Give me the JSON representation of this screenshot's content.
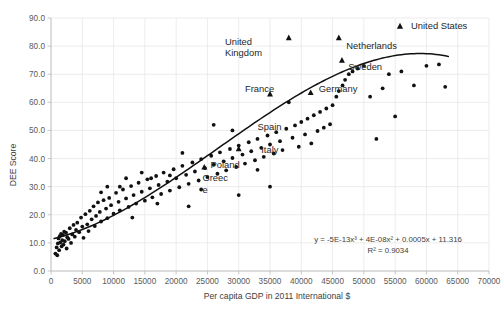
{
  "chart_data": {
    "type": "scatter",
    "title": "",
    "xlabel": "Per capita GDP in 2011 International $",
    "ylabel": "DEE Score",
    "xlim": [
      0,
      70000
    ],
    "ylim": [
      0.0,
      90.0
    ],
    "xticks": [
      "0",
      "5000",
      "10000",
      "15000",
      "20000",
      "25000",
      "30000",
      "35000",
      "40000",
      "45000",
      "50000",
      "55000",
      "60000",
      "65000",
      "70000"
    ],
    "yticks": [
      "0.0",
      "10.0",
      "20.0",
      "30.0",
      "40.0",
      "50.0",
      "60.0",
      "70.0",
      "80.0",
      "90.0"
    ],
    "grid": true,
    "legend": {
      "position": "top-right",
      "entries": [
        {
          "label": "United States",
          "marker": "triangle"
        }
      ]
    },
    "annotations": {
      "equation": "y = -5E-13x³ + 4E-08x² + 0.0005x + 11.316",
      "r_squared": "R² = 0.9034"
    },
    "trendline": {
      "kind": "cubic-polynomial",
      "coefficients": {
        "x3": -5e-13,
        "x2": 4e-08,
        "x1": 0.0005,
        "x0": 11.316
      }
    },
    "series": [
      {
        "name": "Countries",
        "marker": "circle",
        "points": [
          [
            700,
            6.2
          ],
          [
            900,
            8.4
          ],
          [
            1000,
            5.6
          ],
          [
            1100,
            9.8
          ],
          [
            1200,
            11.6
          ],
          [
            1300,
            7.4
          ],
          [
            1400,
            12.4
          ],
          [
            1500,
            10.2
          ],
          [
            1600,
            13.2
          ],
          [
            1700,
            8.8
          ],
          [
            1800,
            11.0
          ],
          [
            1900,
            12.8
          ],
          [
            2000,
            9.4
          ],
          [
            2100,
            14.0
          ],
          [
            2200,
            10.6
          ],
          [
            2400,
            13.6
          ],
          [
            2500,
            8.0
          ],
          [
            2600,
            12.0
          ],
          [
            2800,
            11.4
          ],
          [
            3000,
            15.2
          ],
          [
            3200,
            10.0
          ],
          [
            3400,
            13.0
          ],
          [
            3600,
            16.4
          ],
          [
            3800,
            12.2
          ],
          [
            4000,
            14.6
          ],
          [
            4200,
            17.2
          ],
          [
            4500,
            13.8
          ],
          [
            4800,
            19.0
          ],
          [
            5000,
            15.8
          ],
          [
            5200,
            11.8
          ],
          [
            5500,
            20.2
          ],
          [
            5800,
            16.6
          ],
          [
            6000,
            14.2
          ],
          [
            6200,
            21.4
          ],
          [
            6500,
            18.4
          ],
          [
            6800,
            23.0
          ],
          [
            7000,
            16.0
          ],
          [
            7200,
            19.6
          ],
          [
            7500,
            24.4
          ],
          [
            7800,
            21.0
          ],
          [
            8000,
            17.6
          ],
          [
            8400,
            25.2
          ],
          [
            8800,
            22.2
          ],
          [
            9000,
            18.8
          ],
          [
            9300,
            26.0
          ],
          [
            9600,
            23.4
          ],
          [
            10000,
            20.4
          ],
          [
            10400,
            27.8
          ],
          [
            10800,
            24.6
          ],
          [
            11000,
            21.6
          ],
          [
            11500,
            29.0
          ],
          [
            12000,
            25.8
          ],
          [
            12400,
            22.8
          ],
          [
            12800,
            30.2
          ],
          [
            13200,
            27.0
          ],
          [
            13600,
            24.0
          ],
          [
            14000,
            31.4
          ],
          [
            14500,
            28.2
          ],
          [
            15000,
            25.0
          ],
          [
            15400,
            32.6
          ],
          [
            15800,
            29.4
          ],
          [
            16200,
            26.2
          ],
          [
            16800,
            33.8
          ],
          [
            17200,
            30.6
          ],
          [
            17600,
            27.4
          ],
          [
            18000,
            35.0
          ],
          [
            18600,
            31.8
          ],
          [
            19000,
            28.6
          ],
          [
            19600,
            36.2
          ],
          [
            20000,
            33.0
          ],
          [
            20500,
            29.8
          ],
          [
            21000,
            37.4
          ],
          [
            21600,
            34.2
          ],
          [
            22000,
            31.0
          ],
          [
            22600,
            38.6
          ],
          [
            23000,
            35.4
          ],
          [
            23600,
            32.2
          ],
          [
            24000,
            39.8
          ],
          [
            24600,
            36.6
          ],
          [
            25000,
            33.4
          ],
          [
            25600,
            41.0
          ],
          [
            26000,
            37.8
          ],
          [
            26600,
            34.6
          ],
          [
            27000,
            42.2
          ],
          [
            27600,
            39.0
          ],
          [
            28000,
            35.8
          ],
          [
            28600,
            43.4
          ],
          [
            29000,
            40.2
          ],
          [
            29600,
            37.0
          ],
          [
            30000,
            44.6
          ],
          [
            30600,
            41.4
          ],
          [
            31000,
            38.2
          ],
          [
            31600,
            45.8
          ],
          [
            32000,
            42.6
          ],
          [
            32600,
            39.4
          ],
          [
            33000,
            47.0
          ],
          [
            33600,
            43.8
          ],
          [
            34000,
            40.6
          ],
          [
            34600,
            48.2
          ],
          [
            35000,
            45.0
          ],
          [
            35600,
            41.8
          ],
          [
            36000,
            49.4
          ],
          [
            36600,
            46.2
          ],
          [
            37000,
            43.0
          ],
          [
            37600,
            50.6
          ],
          [
            38000,
            60.0
          ],
          [
            38600,
            47.4
          ],
          [
            39000,
            51.8
          ],
          [
            39600,
            44.2
          ],
          [
            40000,
            53.0
          ],
          [
            40600,
            48.6
          ],
          [
            41000,
            54.2
          ],
          [
            41600,
            45.4
          ],
          [
            42000,
            55.4
          ],
          [
            42600,
            49.8
          ],
          [
            43000,
            56.6
          ],
          [
            43600,
            51.0
          ],
          [
            44000,
            57.8
          ],
          [
            44600,
            52.2
          ],
          [
            45000,
            59.0
          ],
          [
            45600,
            62.0
          ],
          [
            46000,
            64.0
          ],
          [
            46600,
            66.0
          ],
          [
            47000,
            68.0
          ],
          [
            47600,
            70.0
          ],
          [
            48200,
            71.0
          ],
          [
            49000,
            72.0
          ],
          [
            50000,
            73.0
          ],
          [
            51000,
            62.0
          ],
          [
            52000,
            47.0
          ],
          [
            53000,
            65.0
          ],
          [
            54000,
            70.0
          ],
          [
            55000,
            55.0
          ],
          [
            56000,
            71.0
          ],
          [
            58000,
            66.0
          ],
          [
            60000,
            73.0
          ],
          [
            62000,
            73.5
          ],
          [
            63000,
            65.5
          ],
          [
            35000,
            30.0
          ],
          [
            30000,
            27.0
          ],
          [
            26000,
            52.0
          ],
          [
            21000,
            42.0
          ],
          [
            19000,
            34.0
          ],
          [
            17000,
            24.0
          ],
          [
            13000,
            19.0
          ],
          [
            11000,
            30.0
          ],
          [
            9000,
            30.0
          ],
          [
            8000,
            28.0
          ],
          [
            16000,
            33.0
          ],
          [
            22000,
            23.0
          ],
          [
            29000,
            50.0
          ],
          [
            33000,
            36.0
          ],
          [
            24000,
            29.0
          ],
          [
            12000,
            33.0
          ],
          [
            14500,
            35.0
          ]
        ]
      },
      {
        "name": "Highlighted countries",
        "marker": "triangle",
        "points": [
          [
            38000,
            83.0
          ],
          [
            35000,
            63.0
          ],
          [
            46000,
            83.0
          ],
          [
            46500,
            75.0
          ],
          [
            41500,
            63.5
          ],
          [
            30000,
            43.5
          ],
          [
            24500,
            37.0
          ]
        ]
      }
    ],
    "point_labels": [
      {
        "text_lines": [
          "United",
          "Kingdom"
        ],
        "x": 27800,
        "y": 80.5,
        "align": "start"
      },
      {
        "text_lines": [
          "Netherlands"
        ],
        "x": 47200,
        "y": 79.0,
        "align": "start"
      },
      {
        "text_lines": [
          "Sweden"
        ],
        "x": 47500,
        "y": 71.5,
        "align": "start"
      },
      {
        "text_lines": [
          "France"
        ],
        "x": 31000,
        "y": 63.5,
        "align": "start"
      },
      {
        "text_lines": [
          "Germany"
        ],
        "x": 42800,
        "y": 63.5,
        "align": "start"
      },
      {
        "text_lines": [
          "Spain"
        ],
        "x": 33000,
        "y": 50.0,
        "align": "start"
      },
      {
        "text_lines": [
          "Italy"
        ],
        "x": 33600,
        "y": 42.0,
        "align": "start"
      },
      {
        "text_lines": [
          "Poland"
        ],
        "x": 25500,
        "y": 36.5,
        "align": "start"
      },
      {
        "text_lines": [
          "Greec",
          "e"
        ],
        "x": 24200,
        "y": 32.0,
        "align": "start"
      }
    ]
  }
}
